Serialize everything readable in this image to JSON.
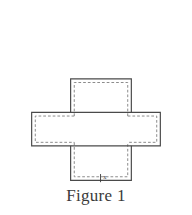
{
  "figure": {
    "caption": "Figure 1",
    "diagram_type": "box-net-cross",
    "dimension_label": "x"
  },
  "colors": {
    "background": "#ffffff",
    "outline": "#4a4a4a",
    "dashed": "#8c8c8c",
    "caption_text": "#3a3a3a",
    "fill": "#ffffff"
  },
  "geometry": {
    "top_panel": {
      "x": 68,
      "y": 12,
      "width": 67,
      "height": 37
    },
    "middle_bar": {
      "x": 25,
      "y": 49,
      "width": 142,
      "height": 37
    },
    "bottom_panel": {
      "x": 68,
      "y": 86,
      "width": 67,
      "height": 38
    },
    "stroke_width": 1.2,
    "dash_inset": 4,
    "dash_pattern": "3,2.2"
  },
  "strokes": {
    "solid_outline_path": "M68 12 L135 12 L135 49 L167 49 L167 86 L135 86 L135 124 L68 124 L68 86 L25 86 L25 49 L68 49 Z",
    "dashed_segments": [
      {
        "name": "top-panel-dashed-left",
        "x1": 72,
        "y1": 16,
        "x2": 72,
        "y2": 53
      },
      {
        "name": "top-panel-dashed-top",
        "x1": 72,
        "y1": 16,
        "x2": 131,
        "y2": 16
      },
      {
        "name": "top-panel-dashed-right",
        "x1": 131,
        "y1": 16,
        "x2": 131,
        "y2": 53
      },
      {
        "name": "middle-bar-dashed-top-left",
        "x1": 29,
        "y1": 53,
        "x2": 72,
        "y2": 53
      },
      {
        "name": "middle-bar-dashed-top-right",
        "x1": 131,
        "y1": 53,
        "x2": 163,
        "y2": 53
      },
      {
        "name": "middle-bar-dashed-left",
        "x1": 29,
        "y1": 53,
        "x2": 29,
        "y2": 82
      },
      {
        "name": "middle-bar-dashed-right",
        "x1": 163,
        "y1": 53,
        "x2": 163,
        "y2": 82
      },
      {
        "name": "middle-bar-dashed-bot-left",
        "x1": 29,
        "y1": 82,
        "x2": 72,
        "y2": 82
      },
      {
        "name": "middle-bar-dashed-bot-right",
        "x1": 131,
        "y1": 82,
        "x2": 163,
        "y2": 82
      },
      {
        "name": "bottom-panel-dashed-left",
        "x1": 72,
        "y1": 82,
        "x2": 72,
        "y2": 120
      },
      {
        "name": "bottom-panel-dashed-right",
        "x1": 131,
        "y1": 82,
        "x2": 131,
        "y2": 120
      },
      {
        "name": "bottom-panel-dashed-bot",
        "x1": 72,
        "y1": 120,
        "x2": 131,
        "y2": 120
      }
    ]
  }
}
